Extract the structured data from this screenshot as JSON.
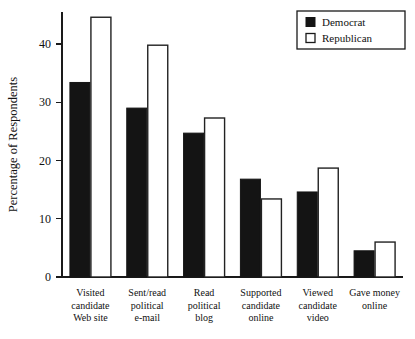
{
  "chart_data": {
    "type": "bar",
    "title": "",
    "subtitle": "",
    "xlabel": "",
    "ylabel": "Percentage of Respondents",
    "ylim": [
      0,
      45.5
    ],
    "yticks": [
      0,
      10,
      20,
      30,
      40
    ],
    "ytick_labels": [
      "0",
      "10",
      "20",
      "30",
      "40"
    ],
    "grid": false,
    "legend_position": "top-right",
    "categories": [
      "Visited\ncandidate\nWeb site",
      "Sent/read\npolitical\ne-mail",
      "Read\npolitical\nblog",
      "Supported\ncandidate\nonline",
      "Viewed\ncandidate\nvideo",
      "Gave money\nonline"
    ],
    "category_lines": [
      [
        "Visited",
        "candidate",
        "Web site"
      ],
      [
        "Sent/read",
        "political",
        "e-mail"
      ],
      [
        "Read",
        "political",
        "blog"
      ],
      [
        "Supported",
        "candidate",
        "online"
      ],
      [
        "Viewed",
        "candidate",
        "video"
      ],
      [
        "Gave money",
        "online"
      ]
    ],
    "series": [
      {
        "name": "Democrat",
        "color": "#141414",
        "values": [
          33.4,
          29.0,
          24.7,
          16.8,
          14.6,
          4.5
        ]
      },
      {
        "name": "Republican",
        "color": "#ffffff",
        "values": [
          44.6,
          39.8,
          27.3,
          13.4,
          18.7,
          6.0
        ]
      }
    ]
  },
  "legend": {
    "items": [
      {
        "label": "Democrat",
        "swatch": "filled-black-square"
      },
      {
        "label": "Republican",
        "swatch": "open-white-square"
      }
    ]
  },
  "axes": {
    "y_title": "Percentage of Respondents"
  }
}
